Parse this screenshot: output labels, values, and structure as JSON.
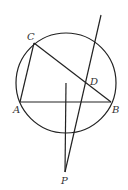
{
  "diagram": {
    "type": "geometry",
    "labels": {
      "A": "A",
      "B": "B",
      "C": "C",
      "D": "D",
      "P": "P"
    },
    "circle": {
      "cx": 66,
      "cy": 83,
      "r": 50
    },
    "points": {
      "A": [
        20,
        102
      ],
      "B": [
        111,
        102
      ],
      "C": [
        34,
        43
      ],
      "D": [
        87,
        85
      ],
      "P": [
        65,
        172
      ]
    },
    "segments": [
      [
        "A",
        "B"
      ],
      [
        "A",
        "C"
      ],
      [
        "C",
        "B"
      ],
      [
        "P",
        "D",
        "extended"
      ],
      [
        "P",
        "perpendicular-to-AB"
      ]
    ],
    "colors": {
      "stroke": "#222222",
      "label": "#333333",
      "background": "#ffffff"
    }
  }
}
